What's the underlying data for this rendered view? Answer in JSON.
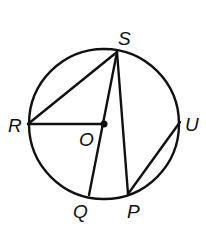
{
  "diagram": {
    "type": "circle-geometry",
    "circle": {
      "center": "O",
      "cx": 104,
      "cy": 124,
      "r": 76
    },
    "points": {
      "S": {
        "x": 117,
        "y": 52,
        "label": "S",
        "lx": 118,
        "ly": 45
      },
      "R": {
        "x": 28,
        "y": 124,
        "label": "R",
        "lx": 8,
        "ly": 132
      },
      "O": {
        "x": 104,
        "y": 124,
        "label": "O",
        "lx": 79,
        "ly": 146
      },
      "U": {
        "x": 180,
        "y": 122,
        "label": "U",
        "lx": 185,
        "ly": 131
      },
      "Q": {
        "x": 89,
        "y": 195,
        "label": "Q",
        "lx": 73,
        "ly": 218
      },
      "P": {
        "x": 128,
        "y": 194,
        "label": "P",
        "lx": 127,
        "ly": 218
      }
    },
    "segments": [
      {
        "from": "R",
        "to": "S",
        "name": "chord-RS"
      },
      {
        "from": "R",
        "to": "O",
        "name": "radius-RO"
      },
      {
        "from": "S",
        "to": "Q",
        "name": "chord-SQ-through-O"
      },
      {
        "from": "S",
        "to": "P",
        "name": "chord-SP"
      },
      {
        "from": "P",
        "to": "U",
        "name": "chord-PU"
      }
    ],
    "labels": [
      "S",
      "R",
      "O",
      "U",
      "Q",
      "P"
    ]
  }
}
